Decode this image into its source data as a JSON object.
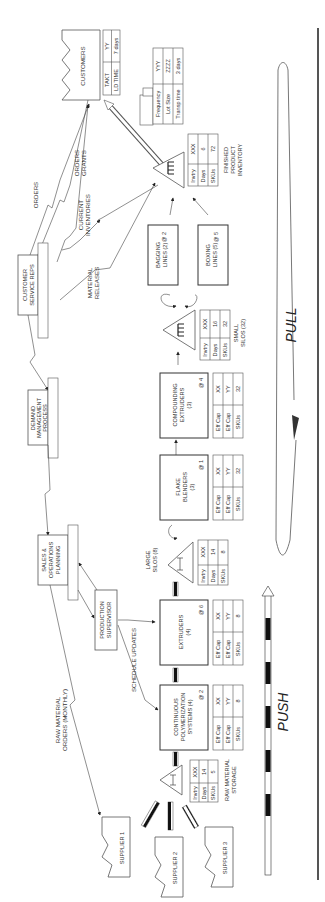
{
  "diagram": {
    "orientation": "rotated-90-ccw",
    "customers": {
      "label": "CUSTOMERS",
      "table": [
        [
          "TAKT",
          "YY"
        ],
        [
          "LD TIME",
          "7 days"
        ]
      ]
    },
    "shipping": {
      "table": [
        [
          "Frequency",
          "YYY"
        ],
        [
          "Lot Size",
          "ZZZZ"
        ],
        [
          "Transp time",
          "3 days"
        ]
      ]
    },
    "finished_inventory": {
      "label_lines": [
        "FINISHED",
        "PRODUCT",
        "INVENTORY"
      ],
      "table": [
        [
          "Invtry",
          "XXX"
        ],
        [
          "Days",
          "6"
        ],
        [
          "SKUs",
          "72"
        ]
      ]
    },
    "customer_service": {
      "label_lines": [
        "CUSTOMER",
        "SERVICE REPS"
      ]
    },
    "demand_management": {
      "label_lines": [
        "DEMAND",
        "MANAGEMENT",
        "PROCESS"
      ]
    },
    "sop": {
      "label_lines": [
        "SALES &",
        "OPERATIONS",
        "PLANNING"
      ]
    },
    "production_supervisor": {
      "label_lines": [
        "PRODUCTION",
        "SUPERVISOR"
      ]
    },
    "flows": {
      "orders": "ORDERS",
      "orders_grants": [
        "ORDERS",
        "GRANTS"
      ],
      "current_inventories": [
        "CURRENT",
        "INVENTORIES"
      ],
      "material_releases": [
        "MATERIAL",
        "RELEASES"
      ],
      "schedule_updates": "SCHEDULE UPDATES",
      "raw_material_orders": [
        "RAW MATERIAL",
        "ORDERS (MONTHLY)"
      ]
    },
    "bagging": {
      "label_lines": [
        "BAGGING",
        "LINES (2)"
      ],
      "count": "@ 2"
    },
    "boxing": {
      "label_lines": [
        "BOXING",
        "LINES (5)"
      ],
      "count": "@ 5"
    },
    "small_silos": {
      "label_lines": [
        "SMALL",
        "SILOS (32)"
      ],
      "table": [
        [
          "Invtry",
          "XXX"
        ],
        [
          "Days",
          "16"
        ],
        [
          "SKUs",
          "32"
        ]
      ]
    },
    "compounding": {
      "label_lines": [
        "COMPOUNDING",
        "EXTRUDERS",
        "(3)"
      ],
      "count": "@ 4",
      "table": [
        [
          "Eff Cap",
          "XX"
        ],
        [
          "Eff Cap",
          "YY"
        ],
        [
          "SKUs",
          "32"
        ]
      ]
    },
    "flake_blenders": {
      "label_lines": [
        "FLAKE",
        "BLENDERS",
        "(3)"
      ],
      "count": "@ 1",
      "table": [
        [
          "Eff Cap",
          "XX"
        ],
        [
          "Eff Cap",
          "YY"
        ],
        [
          "SKUs",
          "32"
        ]
      ]
    },
    "large_silos": {
      "label_lines": [
        "LARGE",
        "SILOS (8)"
      ],
      "table": [
        [
          "Invtry",
          "XXX"
        ],
        [
          "Days",
          "14"
        ],
        [
          "SKUs",
          "8"
        ]
      ]
    },
    "extruders": {
      "label_lines": [
        "EXTRUDERS",
        "(4)"
      ],
      "count": "@ 6",
      "table": [
        [
          "Eff Cap",
          "XX"
        ],
        [
          "Eff Cap",
          "YY"
        ],
        [
          "SKUs",
          "8"
        ]
      ]
    },
    "cps": {
      "label_lines": [
        "CONTINUOUS",
        "POLYMERIZATION",
        "SYSTEMS (4)"
      ],
      "count": "@ 2",
      "table": [
        [
          "Eff Cap",
          "XX"
        ],
        [
          "Eff Cap",
          "YY"
        ],
        [
          "SKUs",
          "8"
        ]
      ]
    },
    "raw_material": {
      "label_lines": [
        "RAW MATERIAL",
        "STORAGE"
      ],
      "table": [
        [
          "Invtry",
          "XXX"
        ],
        [
          "Days",
          "14"
        ],
        [
          "SKUs",
          "5"
        ]
      ]
    },
    "suppliers": [
      "SUPPLIER 1",
      "SUPPLIER 2",
      "SUPPLIER 3"
    ],
    "pull_label": "PULL",
    "push_label": "PUSH"
  }
}
